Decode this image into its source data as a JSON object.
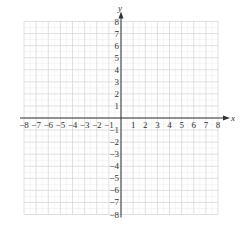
{
  "chart_data": {
    "type": "scatter",
    "title": "",
    "xlabel": "x",
    "ylabel": "y",
    "xlim": [
      -8,
      8
    ],
    "ylim": [
      -8,
      8
    ],
    "grid": true,
    "x_ticks": [
      -8,
      -7,
      -6,
      -5,
      -4,
      -3,
      -2,
      -1,
      1,
      2,
      3,
      4,
      5,
      6,
      7,
      8
    ],
    "y_ticks": [
      8,
      7,
      6,
      5,
      4,
      3,
      2,
      1,
      -1,
      -2,
      -3,
      -4,
      -5,
      -6,
      -7,
      -8
    ],
    "x_tick_labels": [
      "−8",
      "−7",
      "−6",
      "−5",
      "−4",
      "−3",
      "−2",
      "−1",
      "1",
      "2",
      "3",
      "4",
      "5",
      "6",
      "7",
      "8"
    ],
    "y_tick_labels": [
      "8",
      "7",
      "6",
      "5",
      "4",
      "3",
      "2",
      "1",
      "−1",
      "−2",
      "−3",
      "−4",
      "−5",
      "−6",
      "−7",
      "−8"
    ],
    "points": [],
    "colors": {
      "grid": "#d8d8d8",
      "axis": "#333333",
      "text": "#333333"
    }
  }
}
